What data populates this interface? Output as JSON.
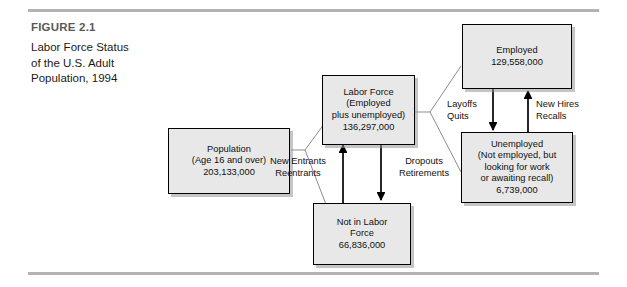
{
  "figure": {
    "label": "FIGURE 2.1",
    "caption": "Labor Force Status\nof the U.S. Adult\nPopulation, 1994"
  },
  "colors": {
    "box_fill": "#e8e8e8",
    "box_border": "#000000",
    "rule": "#b3b3b3",
    "caption_label": "#595959",
    "text": "#111111"
  },
  "diagram": {
    "type": "flowchart",
    "boxes": [
      {
        "id": "population",
        "text": "Population\n(Age 16 and over)\n203,133,000",
        "title": "Population",
        "detail": "(Age 16 and over)",
        "value": "203,133,000"
      },
      {
        "id": "labor-force",
        "text": "Labor Force\n(Employed\nplus unemployed)\n136,297,000",
        "title": "Labor Force",
        "detail": "(Employed plus unemployed)",
        "value": "136,297,000"
      },
      {
        "id": "not-in-labor-force",
        "text": "Not in Labor\nForce\n66,836,000",
        "title": "Not in Labor Force",
        "detail": "",
        "value": "66,836,000"
      },
      {
        "id": "employed",
        "text": "Employed\n129,558,000",
        "title": "Employed",
        "detail": "",
        "value": "129,558,000"
      },
      {
        "id": "unemployed",
        "text": "Unemployed\n(Not employed, but\nlooking for work\nor awaiting recall)\n6,739,000",
        "title": "Unemployed",
        "detail": "(Not employed, but looking for work or awaiting recall)",
        "value": "6,739,000"
      }
    ],
    "edge_labels": [
      {
        "id": "new-entrants",
        "text": "New Entrants\nReentrants",
        "from": "not-in-labor-force",
        "to": "labor-force"
      },
      {
        "id": "dropouts",
        "text": "Dropouts\nRetirements",
        "from": "labor-force",
        "to": "not-in-labor-force"
      },
      {
        "id": "layoffs",
        "text": "Layoffs\nQuits",
        "from": "employed",
        "to": "unemployed"
      },
      {
        "id": "new-hires",
        "text": "New Hires\nRecalls",
        "from": "unemployed",
        "to": "employed"
      }
    ]
  }
}
